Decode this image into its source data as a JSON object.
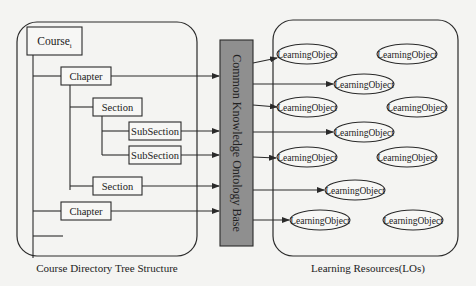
{
  "colors": {
    "background": "#f4f4f2",
    "stroke": "#2a2a2a",
    "ontology_fill": "#8f8f8f",
    "node_fill": "#f7f7f5"
  },
  "left_panel": {
    "caption": "Course Directory Tree Structure",
    "nodes": [
      {
        "id": "course",
        "label": "Course",
        "subscript": "i",
        "x": 27,
        "y": 27,
        "w": 55,
        "h": 28
      },
      {
        "id": "chapter1",
        "label": "Chapter",
        "x": 61,
        "y": 67,
        "w": 50,
        "h": 18
      },
      {
        "id": "section1",
        "label": "Section",
        "x": 93,
        "y": 98,
        "w": 49,
        "h": 18
      },
      {
        "id": "subsection1",
        "label": "SubSection",
        "x": 129,
        "y": 122,
        "w": 52,
        "h": 18
      },
      {
        "id": "subsection2",
        "label": "SubSection",
        "x": 129,
        "y": 146,
        "w": 52,
        "h": 18
      },
      {
        "id": "section2",
        "label": "Section",
        "x": 93,
        "y": 177,
        "w": 49,
        "h": 18
      },
      {
        "id": "chapter2",
        "label": "Chapter",
        "x": 61,
        "y": 202,
        "w": 50,
        "h": 18
      }
    ]
  },
  "ontology": {
    "label": "Common Knowledge Ontology Base",
    "x": 220,
    "y": 40,
    "w": 33,
    "h": 206
  },
  "right_panel": {
    "caption": "Learning Resources(LOs)",
    "objects": [
      {
        "label": "LearningObject",
        "cx": 307,
        "cy": 54,
        "rx": 30,
        "ry": 10
      },
      {
        "label": "LearningObject",
        "cx": 407,
        "cy": 54,
        "rx": 30,
        "ry": 10
      },
      {
        "label": "LearningObject",
        "cx": 364,
        "cy": 84,
        "rx": 30,
        "ry": 10
      },
      {
        "label": "LearningObject",
        "cx": 307,
        "cy": 107,
        "rx": 30,
        "ry": 10
      },
      {
        "label": "LearningObject",
        "cx": 417,
        "cy": 107,
        "rx": 30,
        "ry": 10
      },
      {
        "label": "LearningObject",
        "cx": 364,
        "cy": 132,
        "rx": 30,
        "ry": 10
      },
      {
        "label": "LearningObject",
        "cx": 307,
        "cy": 157,
        "rx": 30,
        "ry": 10
      },
      {
        "label": "LearningObject",
        "cx": 407,
        "cy": 157,
        "rx": 30,
        "ry": 10
      },
      {
        "label": "LearningObject",
        "cx": 355,
        "cy": 190,
        "rx": 30,
        "ry": 10
      },
      {
        "label": "LearningObject",
        "cx": 320,
        "cy": 220,
        "rx": 30,
        "ry": 10
      },
      {
        "label": "LearningObject",
        "cx": 413,
        "cy": 220,
        "rx": 30,
        "ry": 10
      }
    ]
  }
}
